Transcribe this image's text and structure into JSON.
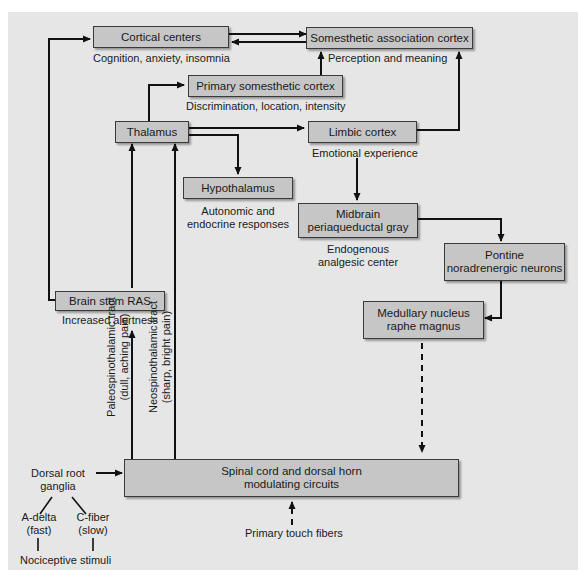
{
  "diagram": {
    "type": "pain pathway flow diagram",
    "nodes": {
      "cortical_centers": {
        "label": "Cortical centers",
        "caption": "Cognition, anxiety, insomnia"
      },
      "somesthetic_association_cortex": {
        "label": "Somesthetic association cortex",
        "caption": "Perception and meaning"
      },
      "primary_somesthetic_cortex": {
        "label": "Primary somesthetic cortex",
        "caption": "Discrimination, location, intensity"
      },
      "thalamus": {
        "label": "Thalamus"
      },
      "limbic_cortex": {
        "label": "Limbic cortex",
        "caption": "Emotional experience"
      },
      "hypothalamus": {
        "label": "Hypothalamus",
        "caption_line1": "Autonomic and",
        "caption_line2": "endocrine responses"
      },
      "midbrain_pag": {
        "label_line1": "Midbrain",
        "label_line2": "periaqueductal gray",
        "caption_line1": "Endogenous",
        "caption_line2": "analgesic center"
      },
      "pontine_neurons": {
        "label_line1": "Pontine",
        "label_line2": "noradrenergic neurons"
      },
      "medullary_nucleus": {
        "label_line1": "Medullary nucleus",
        "label_line2": "raphe magnus"
      },
      "brain_stem_ras": {
        "label": "Brain stem RAS",
        "caption": "Increased alertness"
      },
      "spinal_cord": {
        "label_line1": "Spinal cord and dorsal horn",
        "label_line2": "modulating circuits"
      },
      "dorsal_root_ganglia": {
        "line1": "Dorsal root",
        "line2": "ganglia"
      },
      "a_delta": {
        "line1": "A-delta",
        "line2": "(fast)"
      },
      "c_fiber": {
        "line1": "C-fiber",
        "line2": "(slow)"
      },
      "nociceptive_stimuli": {
        "label": "Nociceptive stimuli"
      },
      "primary_touch_fibers": {
        "label": "Primary touch fibers"
      }
    },
    "tracts": {
      "paleospinothalamic": {
        "line1": "Paleospinothalamic tract",
        "line2": "(dull, aching pain)"
      },
      "neospinothalamic": {
        "line1": "Neospinothalamic tract",
        "line2": "(sharp, bright pain)"
      }
    },
    "edges": [
      {
        "from": "cortical_centers",
        "to": "somesthetic_association_cortex",
        "style": "solid"
      },
      {
        "from": "somesthetic_association_cortex",
        "to": "cortical_centers",
        "style": "solid"
      },
      {
        "from": "primary_somesthetic_cortex",
        "to": "somesthetic_association_cortex",
        "style": "solid"
      },
      {
        "from": "thalamus",
        "to": "primary_somesthetic_cortex",
        "style": "solid"
      },
      {
        "from": "thalamus",
        "to": "limbic_cortex",
        "style": "solid"
      },
      {
        "from": "thalamus",
        "to": "hypothalamus",
        "style": "solid"
      },
      {
        "from": "limbic_cortex",
        "to": "somesthetic_association_cortex",
        "style": "solid"
      },
      {
        "from": "limbic_cortex",
        "to": "midbrain_pag",
        "style": "solid"
      },
      {
        "from": "midbrain_pag",
        "to": "pontine_neurons",
        "style": "solid"
      },
      {
        "from": "pontine_neurons",
        "to": "medullary_nucleus",
        "style": "solid"
      },
      {
        "from": "medullary_nucleus",
        "to": "spinal_cord",
        "style": "dashed"
      },
      {
        "from": "brain_stem_ras",
        "to": "cortical_centers",
        "style": "solid"
      },
      {
        "from": "spinal_cord",
        "to": "brain_stem_ras",
        "style": "solid",
        "via": "paleospinothalamic"
      },
      {
        "from": "brain_stem_ras",
        "to": "thalamus",
        "style": "solid"
      },
      {
        "from": "spinal_cord",
        "to": "thalamus",
        "style": "solid",
        "via": "neospinothalamic"
      },
      {
        "from": "dorsal_root_ganglia",
        "to": "spinal_cord",
        "style": "solid"
      },
      {
        "from": "primary_touch_fibers",
        "to": "spinal_cord",
        "style": "dashed"
      }
    ],
    "colors": {
      "panel": "#e6e6e6",
      "box_fill": "#c6c6c6",
      "line": "#111111"
    }
  }
}
